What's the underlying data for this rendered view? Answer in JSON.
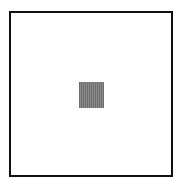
{
  "canvas": {
    "background": "#ffffff",
    "frame": {
      "border_color": "#111111",
      "fill": "#ffffff"
    },
    "square": {
      "color": "#7a7a7a",
      "texture": "vertical-stripes"
    }
  }
}
